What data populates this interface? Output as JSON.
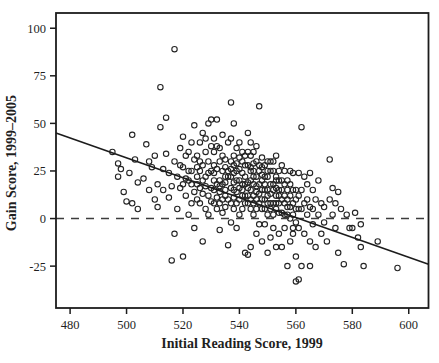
{
  "figure": {
    "background": "#ffffff",
    "ink_color": "#1c1c1c",
    "marker_color": "#242424",
    "dashed_line_color": "#3d3d3d"
  },
  "chart_data": {
    "type": "scatter",
    "title": "",
    "xlabel": "Initial Reading Score, 1999",
    "ylabel": "Gain Score, 1999–2005",
    "xlim": [
      475,
      607
    ],
    "ylim": [
      -47,
      108
    ],
    "xticks": [
      480,
      500,
      520,
      540,
      560,
      580,
      600
    ],
    "yticks": [
      -25,
      0,
      25,
      50,
      75,
      100
    ],
    "grid": false,
    "legend": false,
    "marker": {
      "shape": "open-circle",
      "radius": 2.7
    },
    "reference_line": {
      "y": 0,
      "style": "dashed"
    },
    "trend_line": {
      "x1": 475,
      "y1": 45,
      "x2": 607,
      "y2": -24
    },
    "points": [
      [
        495,
        35
      ],
      [
        497,
        29
      ],
      [
        497,
        22
      ],
      [
        499,
        14
      ],
      [
        502,
        44
      ],
      [
        504,
        19
      ],
      [
        503,
        31
      ],
      [
        501,
        24
      ],
      [
        500,
        9
      ],
      [
        504,
        5
      ],
      [
        498,
        26
      ],
      [
        502,
        8
      ],
      [
        507,
        39
      ],
      [
        506,
        21
      ],
      [
        508,
        15
      ],
      [
        509,
        27
      ],
      [
        510,
        33
      ],
      [
        511,
        18
      ],
      [
        510,
        10
      ],
      [
        508,
        30
      ],
      [
        511,
        6
      ],
      [
        512,
        69
      ],
      [
        512,
        48
      ],
      [
        514,
        53
      ],
      [
        513,
        26
      ],
      [
        515,
        24
      ],
      [
        516,
        17
      ],
      [
        517,
        89
      ],
      [
        517,
        -8
      ],
      [
        516,
        -22
      ],
      [
        515,
        11
      ],
      [
        514,
        34
      ],
      [
        517,
        30
      ],
      [
        518,
        22
      ],
      [
        513,
        15
      ],
      [
        518,
        5
      ],
      [
        519,
        28
      ],
      [
        520,
        43
      ],
      [
        521,
        21
      ],
      [
        520,
        -20
      ],
      [
        522,
        35
      ],
      [
        523,
        18
      ],
      [
        521,
        12
      ],
      [
        524,
        49
      ],
      [
        522,
        25
      ],
      [
        523,
        8
      ],
      [
        519,
        16
      ],
      [
        524,
        31
      ],
      [
        520,
        27
      ],
      [
        522,
        2
      ],
      [
        523,
        40
      ],
      [
        521,
        33
      ],
      [
        524,
        14
      ],
      [
        519,
        37
      ],
      [
        520,
        18
      ],
      [
        523,
        25
      ],
      [
        522,
        20
      ],
      [
        524,
        -5
      ],
      [
        525,
        22
      ],
      [
        526,
        30
      ],
      [
        525,
        10
      ],
      [
        527,
        45
      ],
      [
        528,
        17
      ],
      [
        526,
        25
      ],
      [
        529,
        50
      ],
      [
        530,
        52
      ],
      [
        525,
        33
      ],
      [
        527,
        20
      ],
      [
        528,
        35
      ],
      [
        529,
        12
      ],
      [
        530,
        16
      ],
      [
        526,
        8
      ],
      [
        527,
        28
      ],
      [
        528,
        5
      ],
      [
        529,
        24
      ],
      [
        530,
        38
      ],
      [
        525,
        18
      ],
      [
        526,
        40
      ],
      [
        527,
        13
      ],
      [
        528,
        22
      ],
      [
        529,
        30
      ],
      [
        530,
        9
      ],
      [
        525,
        27
      ],
      [
        526,
        16
      ],
      [
        530,
        25
      ],
      [
        528,
        42
      ],
      [
        529,
        2
      ],
      [
        527,
        -12
      ],
      [
        531,
        20
      ],
      [
        532,
        52
      ],
      [
        533,
        14
      ],
      [
        534,
        25
      ],
      [
        535,
        31
      ],
      [
        531,
        8
      ],
      [
        532,
        18
      ],
      [
        533,
        37
      ],
      [
        534,
        10
      ],
      [
        535,
        22
      ],
      [
        531,
        28
      ],
      [
        532,
        5
      ],
      [
        533,
        20
      ],
      [
        534,
        44
      ],
      [
        535,
        15
      ],
      [
        531,
        35
      ],
      [
        532,
        26
      ],
      [
        533,
        8
      ],
      [
        534,
        18
      ],
      [
        535,
        27
      ],
      [
        531,
        15
      ],
      [
        532,
        38
      ],
      [
        533,
        30
      ],
      [
        534,
        3
      ],
      [
        535,
        12
      ],
      [
        531,
        24
      ],
      [
        532,
        11
      ],
      [
        533,
        -6
      ],
      [
        534,
        33
      ],
      [
        535,
        19
      ],
      [
        536,
        25
      ],
      [
        536,
        10
      ],
      [
        536,
        40
      ],
      [
        536,
        -14
      ],
      [
        531,
        42
      ],
      [
        533,
        17
      ],
      [
        535,
        6
      ],
      [
        536,
        22
      ],
      [
        537,
        61
      ],
      [
        538,
        50
      ],
      [
        537,
        42
      ],
      [
        538,
        15
      ],
      [
        539,
        25
      ],
      [
        540,
        10
      ],
      [
        541,
        30
      ],
      [
        542,
        18
      ],
      [
        537,
        22
      ],
      [
        538,
        33
      ],
      [
        539,
        8
      ],
      [
        540,
        20
      ],
      [
        541,
        12
      ],
      [
        542,
        28
      ],
      [
        537,
        16
      ],
      [
        538,
        5
      ],
      [
        539,
        37
      ],
      [
        540,
        26
      ],
      [
        541,
        18
      ],
      [
        542,
        8
      ],
      [
        537,
        30
      ],
      [
        538,
        24
      ],
      [
        539,
        14
      ],
      [
        540,
        2
      ],
      [
        541,
        35
      ],
      [
        542,
        22
      ],
      [
        537,
        8
      ],
      [
        538,
        19
      ],
      [
        539,
        29
      ],
      [
        540,
        16
      ],
      [
        541,
        5
      ],
      [
        542,
        12
      ],
      [
        537,
        26
      ],
      [
        538,
        11
      ],
      [
        539,
        20
      ],
      [
        540,
        32
      ],
      [
        541,
        24
      ],
      [
        542,
        -18
      ],
      [
        539,
        -5
      ],
      [
        540,
        40
      ],
      [
        538,
        28
      ],
      [
        541,
        15
      ],
      [
        542,
        33
      ],
      [
        537,
        -2
      ],
      [
        543,
        45
      ],
      [
        544,
        20
      ],
      [
        545,
        12
      ],
      [
        546,
        30
      ],
      [
        547,
        59
      ],
      [
        548,
        15
      ],
      [
        543,
        8
      ],
      [
        544,
        25
      ],
      [
        545,
        35
      ],
      [
        546,
        5
      ],
      [
        547,
        18
      ],
      [
        548,
        27
      ],
      [
        543,
        16
      ],
      [
        544,
        10
      ],
      [
        545,
        22
      ],
      [
        546,
        38
      ],
      [
        547,
        8
      ],
      [
        548,
        20
      ],
      [
        543,
        28
      ],
      [
        544,
        33
      ],
      [
        545,
        2
      ],
      [
        546,
        14
      ],
      [
        547,
        25
      ],
      [
        548,
        10
      ],
      [
        543,
        19
      ],
      [
        544,
        5
      ],
      [
        545,
        29
      ],
      [
        546,
        22
      ],
      [
        547,
        13
      ],
      [
        548,
        32
      ],
      [
        543,
        -19
      ],
      [
        544,
        15
      ],
      [
        545,
        18
      ],
      [
        546,
        -8
      ],
      [
        547,
        28
      ],
      [
        548,
        5
      ],
      [
        543,
        35
      ],
      [
        544,
        40
      ],
      [
        545,
        8
      ],
      [
        546,
        17
      ],
      [
        547,
        -3
      ],
      [
        548,
        23
      ],
      [
        543,
        12
      ],
      [
        544,
        27
      ],
      [
        545,
        25
      ],
      [
        546,
        10
      ],
      [
        548,
        -12
      ],
      [
        544,
        -15
      ],
      [
        549,
        10
      ],
      [
        550,
        22
      ],
      [
        551,
        5
      ],
      [
        552,
        15
      ],
      [
        553,
        33
      ],
      [
        554,
        8
      ],
      [
        549,
        18
      ],
      [
        550,
        2
      ],
      [
        551,
        25
      ],
      [
        552,
        -5
      ],
      [
        553,
        12
      ],
      [
        554,
        20
      ],
      [
        549,
        28
      ],
      [
        550,
        15
      ],
      [
        551,
        -10
      ],
      [
        552,
        8
      ],
      [
        553,
        22
      ],
      [
        554,
        3
      ],
      [
        549,
        5
      ],
      [
        550,
        30
      ],
      [
        551,
        18
      ],
      [
        552,
        25
      ],
      [
        553,
        -15
      ],
      [
        554,
        12
      ],
      [
        549,
        22
      ],
      [
        550,
        8
      ],
      [
        551,
        13
      ],
      [
        552,
        18
      ],
      [
        553,
        5
      ],
      [
        554,
        -8
      ],
      [
        549,
        -3
      ],
      [
        550,
        25
      ],
      [
        551,
        30
      ],
      [
        552,
        2
      ],
      [
        553,
        16
      ],
      [
        554,
        25
      ],
      [
        549,
        15
      ],
      [
        550,
        -18
      ],
      [
        551,
        8
      ],
      [
        552,
        30
      ],
      [
        553,
        20
      ],
      [
        554,
        15
      ],
      [
        550,
        12
      ],
      [
        553,
        8
      ],
      [
        555,
        10
      ],
      [
        556,
        18
      ],
      [
        557,
        2
      ],
      [
        558,
        12
      ],
      [
        559,
        24
      ],
      [
        560,
        5
      ],
      [
        555,
        20
      ],
      [
        556,
        -5
      ],
      [
        557,
        15
      ],
      [
        558,
        -12
      ],
      [
        559,
        8
      ],
      [
        560,
        -2
      ],
      [
        555,
        3
      ],
      [
        556,
        25
      ],
      [
        557,
        20
      ],
      [
        558,
        6
      ],
      [
        559,
        -8
      ],
      [
        560,
        15
      ],
      [
        555,
        -15
      ],
      [
        556,
        12
      ],
      [
        557,
        -25
      ],
      [
        558,
        18
      ],
      [
        559,
        2
      ],
      [
        560,
        -33
      ],
      [
        555,
        28
      ],
      [
        556,
        8
      ],
      [
        557,
        10
      ],
      [
        558,
        25
      ],
      [
        559,
        15
      ],
      [
        560,
        -20
      ],
      [
        555,
        15
      ],
      [
        556,
        2
      ],
      [
        558,
        0
      ],
      [
        559,
        -5
      ],
      [
        557,
        6
      ],
      [
        560,
        10
      ],
      [
        561,
        24
      ],
      [
        562,
        48
      ],
      [
        563,
        22
      ],
      [
        564,
        10
      ],
      [
        565,
        24
      ],
      [
        566,
        5
      ],
      [
        561,
        -32
      ],
      [
        562,
        -25
      ],
      [
        565,
        -25
      ],
      [
        563,
        8
      ],
      [
        564,
        18
      ],
      [
        566,
        15
      ],
      [
        561,
        12
      ],
      [
        562,
        5
      ],
      [
        563,
        -8
      ],
      [
        564,
        2
      ],
      [
        565,
        -12
      ],
      [
        566,
        -3
      ],
      [
        561,
        5
      ],
      [
        562,
        15
      ],
      [
        567,
        10
      ],
      [
        568,
        2
      ],
      [
        567,
        -15
      ],
      [
        568,
        20
      ],
      [
        561,
        -5
      ],
      [
        565,
        6
      ],
      [
        569,
        8
      ],
      [
        570,
        6
      ],
      [
        572,
        31
      ],
      [
        572,
        10
      ],
      [
        573,
        16
      ],
      [
        575,
        14
      ],
      [
        569,
        -8
      ],
      [
        571,
        -12
      ],
      [
        574,
        -5
      ],
      [
        575,
        -18
      ],
      [
        570,
        -2
      ],
      [
        573,
        2
      ],
      [
        576,
        5
      ],
      [
        574,
        8
      ],
      [
        577,
        -24
      ],
      [
        578,
        2
      ],
      [
        579,
        -5
      ],
      [
        580,
        -5
      ],
      [
        582,
        -10
      ],
      [
        581,
        3
      ],
      [
        583,
        -3
      ],
      [
        584,
        -25
      ],
      [
        583,
        -15
      ],
      [
        589,
        -12
      ],
      [
        596,
        -26
      ]
    ]
  }
}
